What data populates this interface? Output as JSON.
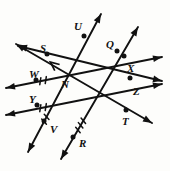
{
  "diagram": {
    "kind": "geometry-line-diagram",
    "background_color": "#fdfdfb",
    "stroke_color": "#111111",
    "point_color": "#111111",
    "canvas": {
      "width": 170,
      "height": 171
    },
    "right_angle_marker": {
      "name": "right-angle-square",
      "vertex": {
        "x": 64,
        "y": 73
      },
      "present": true
    },
    "intersections": [
      {
        "name": "N",
        "x": 64,
        "y": 73
      },
      {
        "name": "unlabeled-right",
        "x": 98,
        "y": 92
      }
    ],
    "points": [
      {
        "label": "S",
        "label_x": 40,
        "label_y": 43,
        "dot_x": 47,
        "dot_y": 54
      },
      {
        "label": "U",
        "label_x": 74,
        "label_y": 21,
        "dot_x": 84,
        "dot_y": 36
      },
      {
        "label": "Q",
        "label_x": 106,
        "label_y": 39,
        "dot_x": 117,
        "dot_y": 51
      },
      {
        "label": "W",
        "label_x": 29,
        "label_y": 69,
        "dot_x": 36,
        "dot_y": 80
      },
      {
        "label": "X",
        "label_x": 127,
        "label_y": 63,
        "dot_x": 124,
        "dot_y": 56
      },
      {
        "label": "N",
        "label_x": 61,
        "label_y": 79,
        "dot_x": null,
        "dot_y": null
      },
      {
        "label": "Z",
        "label_x": 133,
        "label_y": 86,
        "dot_x": 130,
        "dot_y": 78
      },
      {
        "label": "Y",
        "label_x": 29,
        "label_y": 94,
        "dot_x": 37,
        "dot_y": 105
      },
      {
        "label": "V",
        "label_x": 50,
        "label_y": 124,
        "dot_x": 44,
        "dot_y": 121
      },
      {
        "label": "T",
        "label_x": 122,
        "label_y": 116,
        "dot_x": 126,
        "dot_y": 110
      },
      {
        "label": "R",
        "label_x": 79,
        "label_y": 138,
        "dot_x": 73,
        "dot_y": 137
      }
    ],
    "lines": [
      {
        "name": "line-S-N-Z",
        "from": {
          "x": 18,
          "y": 46
        },
        "to": {
          "x": 162,
          "y": 81
        },
        "arrow_start": true,
        "arrow_end": true,
        "ticks": 0
      },
      {
        "name": "line-W-N-X",
        "from": {
          "x": 6,
          "y": 88
        },
        "to": {
          "x": 162,
          "y": 57
        },
        "arrow_start": true,
        "arrow_end": true,
        "ticks": 2
      },
      {
        "name": "line-Y-parallel",
        "from": {
          "x": 6,
          "y": 115
        },
        "to": {
          "x": 162,
          "y": 84
        },
        "arrow_start": true,
        "arrow_end": true,
        "ticks": 2
      },
      {
        "name": "line-V-N-U",
        "from": {
          "x": 28,
          "y": 152
        },
        "to": {
          "x": 101,
          "y": 14
        },
        "arrow_start": true,
        "arrow_end": true,
        "ticks": 2
      },
      {
        "name": "line-R-Q-arrow",
        "from": {
          "x": 61,
          "y": 159
        },
        "to": {
          "x": 138,
          "y": 27
        },
        "arrow_start": true,
        "arrow_end": true,
        "ticks": 3
      },
      {
        "name": "line-S-T-diagonal",
        "from": {
          "x": 16,
          "y": 44
        },
        "to": {
          "x": 152,
          "y": 123
        },
        "arrow_start": true,
        "arrow_end": true,
        "ticks": 0
      }
    ]
  }
}
